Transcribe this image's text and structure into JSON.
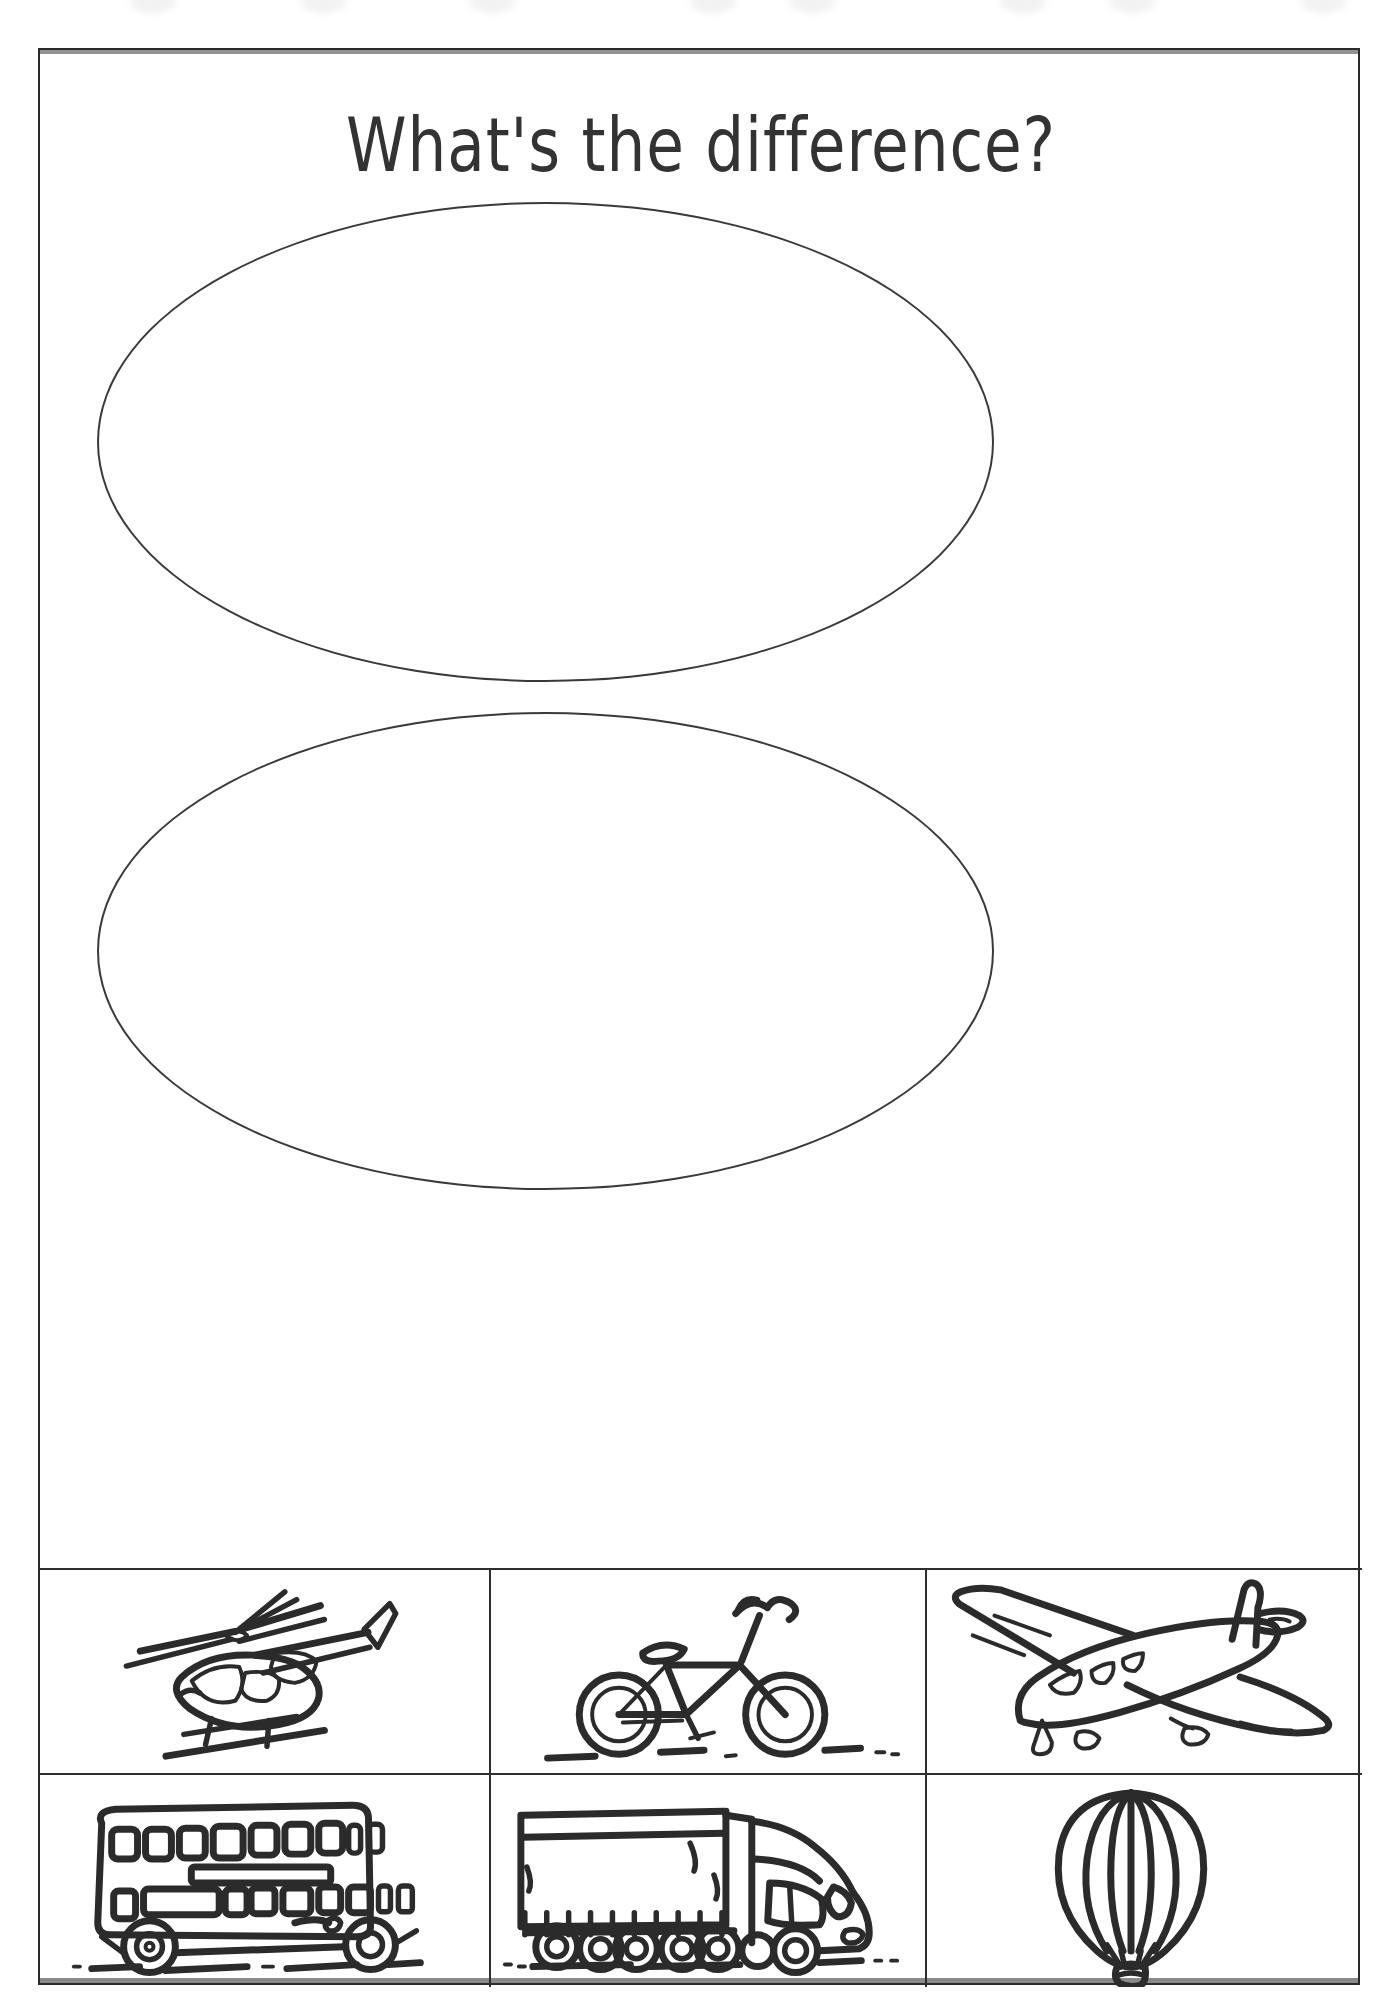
{
  "page": {
    "title": "What's the difference?",
    "background_color": "#ffffff",
    "ink_color": "#2b2b2b",
    "border_color": "#2a2a2a"
  },
  "sorting_regions": [
    {
      "name": "top-ellipse",
      "label": "",
      "shape": "ellipse"
    },
    {
      "name": "bottom-ellipse",
      "label": "",
      "shape": "ellipse"
    }
  ],
  "picture_grid": {
    "rows": 2,
    "columns": 3,
    "cells": [
      {
        "icon": "helicopter-drawing",
        "label": "helicopter"
      },
      {
        "icon": "bicycle-drawing",
        "label": "bicycle"
      },
      {
        "icon": "aeroplane-drawing",
        "label": "aeroplane"
      },
      {
        "icon": "double-decker-bus-drawing",
        "label": "double-decker bus"
      },
      {
        "icon": "lorry-drawing",
        "label": "lorry"
      },
      {
        "icon": "hot-air-balloon-drawing",
        "label": "hot air balloon"
      }
    ]
  },
  "footer": {
    "ghost_text": ""
  }
}
